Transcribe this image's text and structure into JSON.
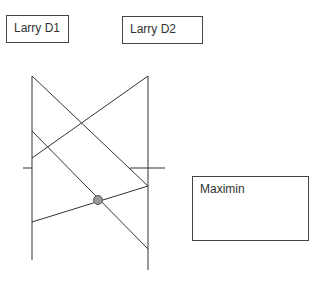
{
  "labels": {
    "d1": "Larry D1",
    "d2": "Larry D2",
    "result": "Maximin"
  },
  "diagram": {
    "left_axis": {
      "x": 32,
      "y1": 76,
      "y2": 260
    },
    "right_axis": {
      "x": 148,
      "y1": 76,
      "y2": 270
    },
    "lines": [
      {
        "x1": 32,
        "y1": 76,
        "x2": 148,
        "y2": 186
      },
      {
        "x1": 32,
        "y1": 158,
        "x2": 148,
        "y2": 76
      },
      {
        "x1": 32,
        "y1": 131,
        "x2": 148,
        "y2": 249
      },
      {
        "x1": 32,
        "y1": 222,
        "x2": 148,
        "y2": 186
      }
    ],
    "maximin_point": {
      "x": 98,
      "y": 200,
      "color": "#999999"
    }
  }
}
